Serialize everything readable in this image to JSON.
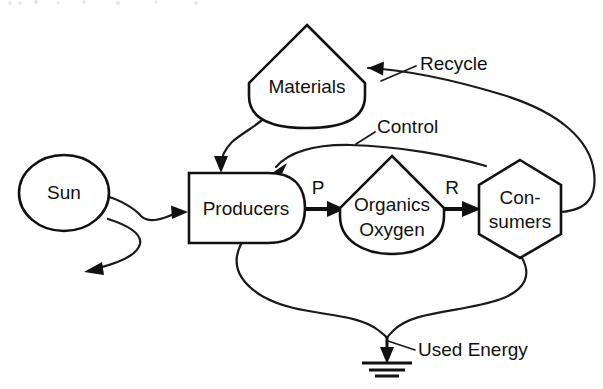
{
  "diagram": {
    "type": "energy-systems-language-diagram",
    "nodes": [
      {
        "id": "sun",
        "label": "Sun",
        "symbol": "source-circle",
        "shape": "circle"
      },
      {
        "id": "materials",
        "label": "Materials",
        "symbol": "storage-tank",
        "shape": "tank"
      },
      {
        "id": "producers",
        "label": "Producers",
        "symbol": "producer-bullet",
        "shape": "bullet"
      },
      {
        "id": "organics-oxygen",
        "label_line1": "Organics",
        "label_line2": "Oxygen",
        "symbol": "storage-tank",
        "shape": "tank"
      },
      {
        "id": "consumers",
        "label_line1": "Con-",
        "label_line2": "sumers",
        "symbol": "consumer-hexagon",
        "shape": "hexagon"
      },
      {
        "id": "heat-sink",
        "label": "",
        "symbol": "heat-sink-ground",
        "shape": "ground"
      }
    ],
    "flow_labels": [
      {
        "id": "p",
        "text": "P",
        "meaning": "production-flow"
      },
      {
        "id": "r",
        "text": "R",
        "meaning": "respiration-flow"
      }
    ],
    "annotations": [
      {
        "id": "recycle",
        "text": "Recycle"
      },
      {
        "id": "control",
        "text": "Control"
      },
      {
        "id": "used-energy",
        "text": "Used Energy"
      }
    ],
    "colors": {
      "stroke": "#111111",
      "fill": "#ffffff",
      "background": "#ffffff"
    }
  }
}
